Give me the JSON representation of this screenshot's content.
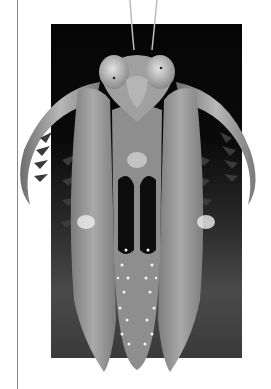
{
  "page": {
    "background": "#ffffff",
    "rule_color": "#8a8a8a"
  },
  "figure": {
    "style": "grayscale photograph",
    "backdrop_color": "#050505",
    "caption": ""
  }
}
